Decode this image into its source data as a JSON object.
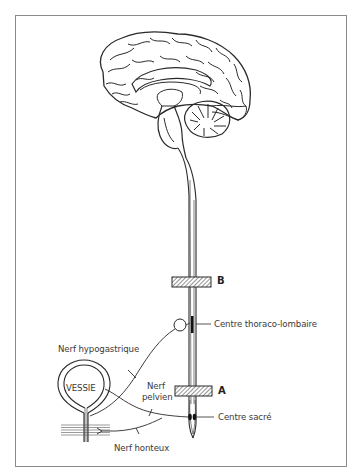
{
  "figure": {
    "type": "anatomical-diagram",
    "colors": {
      "line": "#2a2a2a",
      "label": "#3a3a3a",
      "frame": "#8a8a8a",
      "background": "#ffffff"
    }
  },
  "labels": {
    "level_b": "B",
    "level_a": "A",
    "centre_thoraco_lombaire": "Centre thoraco-lombaire",
    "nerf_hypogastrique": "Nerf hypogastrique",
    "vessie": "VESSIE",
    "nerf_pelvien_line1": "Nerf",
    "nerf_pelvien_line2": "pelvien",
    "centre_sacre": "Centre sacré",
    "nerf_honteux": "Nerf honteux"
  },
  "structures": [
    {
      "name": "brain",
      "description": "Sagittal section of the brain with cerebellum and brainstem"
    },
    {
      "name": "spinal-cord",
      "description": "Spinal cord descending from brainstem"
    },
    {
      "name": "lesion-level-b",
      "label": "B",
      "shape": "hatched-bar"
    },
    {
      "name": "lesion-level-a",
      "label": "A",
      "shape": "hatched-bar"
    },
    {
      "name": "ganglion",
      "shape": "circle"
    },
    {
      "name": "bladder",
      "label": "VESSIE"
    },
    {
      "name": "urethral-sphincter",
      "shape": "striped-band"
    }
  ]
}
